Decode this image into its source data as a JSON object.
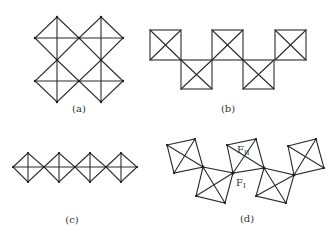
{
  "figure": {
    "panels": [
      {
        "id": "a",
        "label": "(a)",
        "description": "Four octahedra sharing vertices in a square ring (viewed along axis)"
      },
      {
        "id": "b",
        "label": "(b)",
        "description": "Zig-zag chain of corner-sharing octahedra (square projection)"
      },
      {
        "id": "c",
        "label": "(c)",
        "description": "Linear chain of corner-sharing octahedra"
      },
      {
        "id": "d",
        "label": "(d)",
        "description": "Tilted zig-zag chain of corner-sharing octahedra with labelled fluorine sites"
      }
    ],
    "annotations": {
      "f_bridging": {
        "main": "F",
        "sub": "I"
      },
      "f_terminal": {
        "main": "F",
        "sub": "II"
      }
    },
    "colors": {
      "line": "#2a2a2a",
      "background": "#ffffff",
      "text": "#333333"
    }
  }
}
